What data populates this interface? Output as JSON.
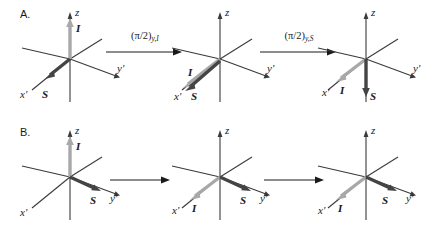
{
  "figure": {
    "background": "#ffffff",
    "axis_color": "#3a3a3a",
    "vector_I_color": "#a8a8a8",
    "vector_S_color": "#444444"
  },
  "rows": [
    {
      "id": "A",
      "label": "A.",
      "panels": [
        {
          "id": "a1",
          "axes": {
            "z": "z",
            "y": "y'",
            "x": "x'"
          },
          "vectors": [
            {
              "name": "I",
              "label": "I",
              "direction": "+z",
              "color": "#a8a8a8"
            },
            {
              "name": "S",
              "label": "S",
              "direction": "+x'",
              "color": "#444444"
            }
          ]
        },
        {
          "id": "a2",
          "axes": {
            "z": "z",
            "y": "y'",
            "x": "x'"
          },
          "vectors": [
            {
              "name": "I",
              "label": "I",
              "direction": "+x'",
              "color": "#a8a8a8"
            },
            {
              "name": "S",
              "label": "S",
              "direction": "+x'",
              "color": "#444444"
            }
          ]
        },
        {
          "id": "a3",
          "axes": {
            "z": "z",
            "y": "y'",
            "x": "x'"
          },
          "vectors": [
            {
              "name": "I",
              "label": "I",
              "direction": "+x'",
              "color": "#a8a8a8"
            },
            {
              "name": "S",
              "label": "S",
              "direction": "-z",
              "color": "#444444"
            }
          ]
        }
      ],
      "transitions": [
        {
          "id": "a-t1",
          "base": "(π/2)",
          "subscript": "y,I",
          "labeled": true
        },
        {
          "id": "a-t2",
          "base": "(π/2)",
          "subscript": "y,S",
          "labeled": true
        }
      ]
    },
    {
      "id": "B",
      "label": "B.",
      "panels": [
        {
          "id": "b1",
          "axes": {
            "z": "z",
            "y": "y'",
            "x": "x'"
          },
          "vectors": [
            {
              "name": "I",
              "label": "I",
              "direction": "+z",
              "color": "#a8a8a8"
            },
            {
              "name": "S",
              "label": "S",
              "direction": "+y'",
              "color": "#444444"
            }
          ]
        },
        {
          "id": "b2",
          "axes": {
            "z": "z",
            "y": "y'",
            "x": "x'"
          },
          "vectors": [
            {
              "name": "I",
              "label": "I",
              "direction": "+x'",
              "color": "#a8a8a8"
            },
            {
              "name": "S",
              "label": "S",
              "direction": "+y'",
              "color": "#444444"
            }
          ]
        },
        {
          "id": "b3",
          "axes": {
            "z": "z",
            "y": "y'",
            "x": "x'"
          },
          "vectors": [
            {
              "name": "I",
              "label": "I",
              "direction": "+x'",
              "color": "#a8a8a8"
            },
            {
              "name": "S",
              "label": "S",
              "direction": "+y'",
              "color": "#444444"
            }
          ]
        }
      ],
      "transitions": [
        {
          "id": "b-t1",
          "base": "",
          "subscript": "",
          "labeled": false
        },
        {
          "id": "b-t2",
          "base": "",
          "subscript": "",
          "labeled": false
        }
      ]
    }
  ]
}
